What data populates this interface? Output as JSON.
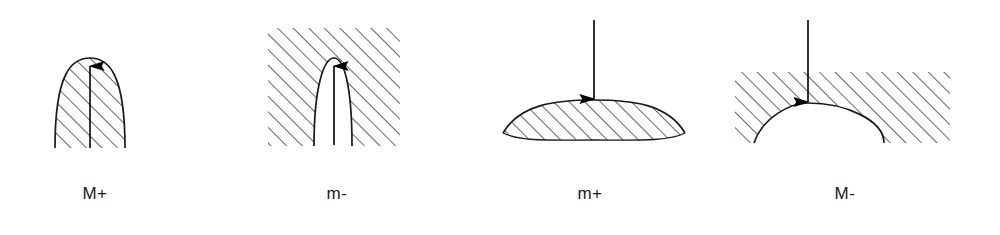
{
  "page": {
    "background": "#ffffff",
    "stroke_color": "#1a1a1a",
    "hatch_color": "#2b2b2b",
    "width": 1000,
    "height": 235
  },
  "figures": [
    {
      "id": "fig-M-plus",
      "label": "M+",
      "shape": "filled-parabolic-dome",
      "hatched_region": "inside-dome",
      "arrow_direction": "up",
      "arrow_tip": "dome-apex",
      "description": "Hatched tall parabolic dome with upward arrow along the axis ending at the apex"
    },
    {
      "id": "fig-m-minus",
      "label": "m-",
      "shape": "parabolic-notch-in-block",
      "hatched_region": "outside-notch",
      "arrow_direction": "up",
      "arrow_tip": "notch-apex",
      "description": "Hatched rectangular block with white parabolic notch cut from below and upward arrow to the apex"
    },
    {
      "id": "fig-m-plus",
      "label": "m+",
      "shape": "flat-lens-dome",
      "hatched_region": "inside-lens",
      "arrow_direction": "down",
      "arrow_tip": "lens-crest",
      "description": "Hatched shallow lens shape with downward arrow touching the crest"
    },
    {
      "id": "fig-M-minus",
      "label": "M-",
      "shape": "dome-cut-from-block",
      "hatched_region": "outside-dome",
      "arrow_direction": "down",
      "arrow_tip": "dome-crest",
      "description": "Hatched rectangular block with a wide white dome removed from below and downward arrow to the crest"
    }
  ]
}
